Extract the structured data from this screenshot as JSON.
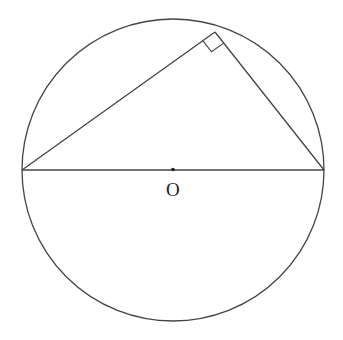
{
  "diagram": {
    "type": "geometry",
    "circle": {
      "cx": 173,
      "cy": 170,
      "r": 151,
      "stroke": "#444444"
    },
    "center_label": "O",
    "diameter": {
      "x1": 22,
      "y1": 170,
      "x2": 324,
      "y2": 170
    },
    "triangle": {
      "vertices": [
        [
          22,
          170
        ],
        [
          215,
          32
        ],
        [
          324,
          170
        ]
      ],
      "right_angle_at": [
        215,
        32
      ]
    },
    "line_color": "#444444"
  }
}
